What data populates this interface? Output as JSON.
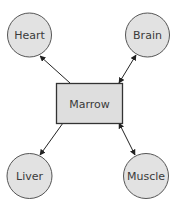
{
  "diagram": {
    "center": {
      "label": "Marrow"
    },
    "nodes": [
      {
        "id": "heart",
        "label": "Heart",
        "arrow": "to-node"
      },
      {
        "id": "brain",
        "label": "Brain",
        "arrow": "bidirectional"
      },
      {
        "id": "liver",
        "label": "Liver",
        "arrow": "to-node"
      },
      {
        "id": "muscle",
        "label": "Muscle",
        "arrow": "bidirectional"
      }
    ],
    "colors": {
      "node_fill": "#e2e2e2",
      "node_stroke": "#555555",
      "box_fill": "#dedede",
      "box_stroke": "#333333",
      "edge": "#222222"
    }
  }
}
